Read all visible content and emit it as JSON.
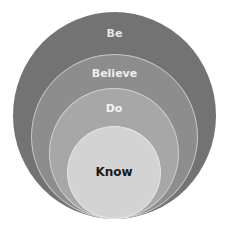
{
  "diagram": {
    "type": "nested-circles",
    "layers": [
      {
        "label": "Be",
        "color": "#727272",
        "text_color": "#e4e4e4"
      },
      {
        "label": "Believe",
        "color": "#8c8c8c",
        "text_color": "#ececec"
      },
      {
        "label": "Do",
        "color": "#a6a6a6",
        "text_color": "#f0f0f0"
      },
      {
        "label": "Know",
        "color": "#d2d2d2",
        "text_color": "#1a1a1a"
      }
    ]
  }
}
